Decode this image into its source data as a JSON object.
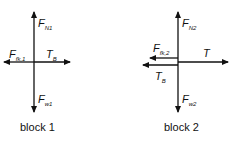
{
  "top_fragment": "(b)",
  "diagrams": [
    {
      "id": "block1",
      "caption": "block 1",
      "forces": [
        {
          "symbol": "F",
          "subscript": "N1",
          "direction": "up"
        },
        {
          "symbol": "F",
          "subscript": "fk,1",
          "direction": "left"
        },
        {
          "symbol": "T",
          "subscript": "B",
          "direction": "right"
        },
        {
          "symbol": "F",
          "subscript": "w1",
          "direction": "down"
        }
      ]
    },
    {
      "id": "block2",
      "caption": "block 2",
      "forces": [
        {
          "symbol": "F",
          "subscript": "N2",
          "direction": "up"
        },
        {
          "symbol": "F",
          "subscript": "fk,2",
          "direction": "left"
        },
        {
          "symbol": "T",
          "subscript": "",
          "direction": "right"
        },
        {
          "symbol": "T",
          "subscript": "B",
          "direction": "left"
        },
        {
          "symbol": "F",
          "subscript": "w2",
          "direction": "down"
        }
      ]
    }
  ],
  "colors": {
    "ink": "#111111",
    "background": "#ffffff"
  }
}
